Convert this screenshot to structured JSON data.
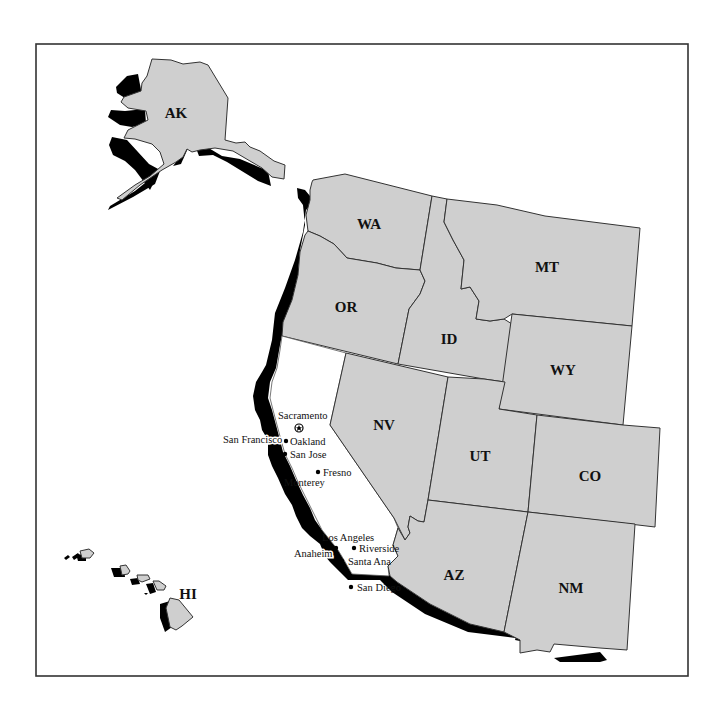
{
  "map": {
    "type": "western-us-states-map",
    "colors": {
      "state_fill": "#cfcfcf",
      "state_stroke": "#333333",
      "highlight_shadow": "#000000",
      "california_fill": "#ffffff",
      "background": "#ffffff"
    },
    "states": [
      {
        "abbr": "AK",
        "label": "AK"
      },
      {
        "abbr": "WA",
        "label": "WA"
      },
      {
        "abbr": "OR",
        "label": "OR"
      },
      {
        "abbr": "ID",
        "label": "ID"
      },
      {
        "abbr": "MT",
        "label": "MT"
      },
      {
        "abbr": "WY",
        "label": "WY"
      },
      {
        "abbr": "NV",
        "label": "NV"
      },
      {
        "abbr": "UT",
        "label": "UT"
      },
      {
        "abbr": "CO",
        "label": "CO"
      },
      {
        "abbr": "AZ",
        "label": "AZ"
      },
      {
        "abbr": "NM",
        "label": "NM"
      },
      {
        "abbr": "HI",
        "label": "HI"
      }
    ],
    "capital": {
      "name": "Sacramento",
      "icon": "star-in-circle-icon"
    },
    "cities": [
      {
        "name": "San Francisco"
      },
      {
        "name": "Oakland"
      },
      {
        "name": "San Jose"
      },
      {
        "name": "Fresno"
      },
      {
        "name": "Monterey"
      },
      {
        "name": "Los Angeles"
      },
      {
        "name": "Riverside"
      },
      {
        "name": "Anaheim"
      },
      {
        "name": "Santa Ana"
      },
      {
        "name": "San Diego"
      }
    ]
  }
}
